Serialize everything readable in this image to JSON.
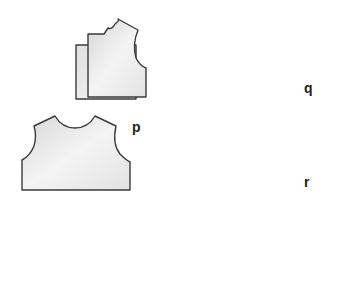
{
  "diagram": {
    "labels": {
      "p": "p",
      "q": "q",
      "r": "r"
    },
    "pieces": [
      {
        "id": "bodice-front-stacked",
        "description": "Two stacked half-bodice front pattern pieces"
      },
      {
        "id": "bodice-back-p",
        "description": "Full bodice back pattern piece",
        "label": "p"
      },
      {
        "id": "bodice-with-center-seam-q",
        "description": "Bodice piece with center seam and seam allowance marks",
        "label": "q"
      },
      {
        "id": "sleeve-stacked",
        "description": "Two stacked sleeve cap pattern pieces"
      },
      {
        "id": "sleeve-with-seam-r",
        "description": "Sleeve cap piece with dashed seam line",
        "label": "r"
      }
    ],
    "colors": {
      "outline": "#3a3a3a",
      "fill_light": "#f2f2f2",
      "fill_dark": "#d4d4d4",
      "seam": "#8a8a8a"
    }
  }
}
